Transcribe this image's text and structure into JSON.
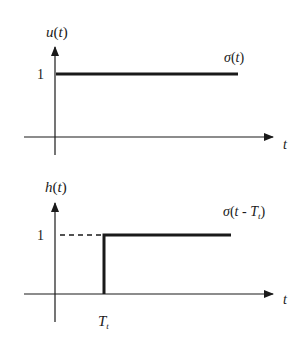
{
  "top_plot": {
    "y_label": {
      "fn": "u",
      "arg": "t"
    },
    "level_label": "1",
    "curve_label": {
      "fn": "σ",
      "arg": "t"
    },
    "x_label": "t"
  },
  "bottom_plot": {
    "y_label": {
      "fn": "h",
      "arg": "t"
    },
    "level_label": "1",
    "curve_label": {
      "fn": "σ",
      "arg": "t - ",
      "sym": "T",
      "sub": "t"
    },
    "x_label": "t",
    "delay_label": {
      "sym": "T",
      "sub": "t"
    }
  },
  "colors": {
    "line": "#1a1a1a",
    "background": "#ffffff"
  }
}
